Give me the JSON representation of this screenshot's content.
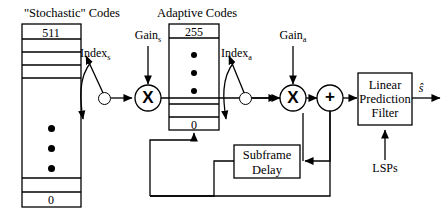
{
  "diagram": {
    "title_stochastic": "\"Stochastic\" Codes",
    "title_adaptive": "Adaptive Codes",
    "stochastic_codebook": {
      "top_value": "511",
      "bottom_value": "0",
      "ellipsis_dots": 3
    },
    "adaptive_codebook": {
      "top_value": "255",
      "bottom_value": "0",
      "ellipsis_dots": 3
    },
    "labels": {
      "index_stochastic": "Index",
      "index_stochastic_sub": "s",
      "index_adaptive": "Index",
      "index_adaptive_sub": "a",
      "gain_stochastic": "Gain",
      "gain_stochastic_sub": "s",
      "gain_adaptive": "Gain",
      "gain_adaptive_sub": "a",
      "lsps": "LSPs",
      "output": "ŝ"
    },
    "operators": {
      "multiply": "X",
      "add": "+"
    },
    "blocks": {
      "lp_filter_line1": "Linear",
      "lp_filter_line2": "Prediction",
      "lp_filter_line3": "Filter",
      "subframe_delay_line1": "Subframe",
      "subframe_delay_line2": "Delay"
    },
    "colors": {
      "stroke": "#000000",
      "background": "#ffffff"
    }
  }
}
